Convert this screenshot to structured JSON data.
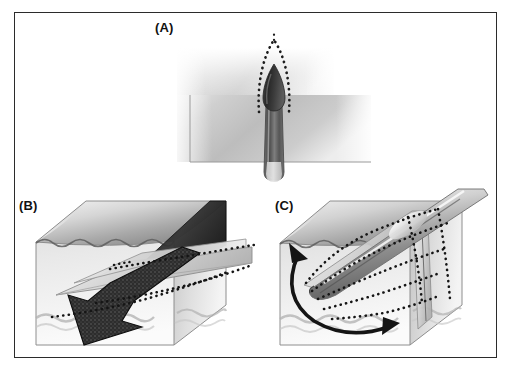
{
  "figure": {
    "background_color": "#ffffff",
    "frame_color": "#2b2b2b",
    "ink_color": "#1a1a1a",
    "rock_light": "#e3e3e3",
    "rock_mid": "#b8b8b8",
    "rock_dark": "#8a8a8a",
    "magma_dark": "#3a3a3a"
  },
  "panels": [
    {
      "id": "A",
      "label": "(A)",
      "view": "cross-section",
      "description": "Vertical cross-section through host rock showing a dike with a teardrop-shaped magma-filled tip fed by a narrow conduit from below; a dotted parabolic line outlines the process zone ahead of the propagating dike tip.",
      "elements": [
        "host-rock-slab",
        "dike-conduit",
        "magma-teardrop-tip",
        "dotted-process-zone-outline"
      ]
    },
    {
      "id": "B",
      "label": "(B)",
      "view": "block-diagram",
      "description": "Three-dimensional block showing a sub-horizontal dike sheet cutting the block, with a broad dark arrow indicating downward-left magma flow direction and dotted lines tracing the dike margins on the hidden faces.",
      "elements": [
        "rock-block",
        "top-surface",
        "dike-sheet",
        "flow-arrow-down-left",
        "dotted-hidden-edges",
        "wavy-stratigraphic-band"
      ]
    },
    {
      "id": "C",
      "label": "(C)",
      "view": "block-diagram",
      "description": "Three-dimensional block showing an inclined tubular dike/conduit breaching the top surface, with radiating dotted trajectory curves and a double-headed curved arrow indicating rotation of the propagation direction.",
      "elements": [
        "rock-block",
        "top-surface",
        "tubular-dike",
        "dotted-radiating-trajectories",
        "double-headed-rotation-arrow",
        "wavy-stratigraphic-band"
      ]
    }
  ],
  "legend": {
    "dotted_line_meaning": "process zone / hidden or projected dike margin",
    "solid_arrow_meaning": "magma flow direction",
    "curved_double_arrow_meaning": "rotation of propagation direction"
  }
}
